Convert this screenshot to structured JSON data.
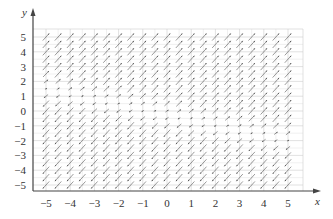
{
  "chart_data": {
    "type": "direction_field",
    "title": "",
    "xlabel": "x",
    "ylabel": "y",
    "xlim": [
      -5,
      5
    ],
    "ylim": [
      -5,
      5
    ],
    "xticks": [
      -5,
      -4,
      -3,
      -2,
      -1,
      0,
      1,
      2,
      3,
      4,
      5
    ],
    "yticks": [
      5,
      4,
      3,
      2,
      1,
      0,
      -1,
      -2,
      -3,
      -4,
      -5
    ],
    "xtick_labels": [
      "−5",
      "−4",
      "−3",
      "−2",
      "−1",
      "0",
      "1",
      "2",
      "3",
      "4",
      "5"
    ],
    "ytick_labels": [
      "5",
      "4",
      "3",
      "2",
      "1",
      "0",
      "−1",
      "−2",
      "−3",
      "−4",
      "−5"
    ],
    "grid": true,
    "sample_spacing": 0.5,
    "nullcline": {
      "x": [
        -5,
        0,
        5
      ],
      "y": [
        1.5,
        -0.25,
        -2
      ]
    },
    "colors": {
      "arrow": "#555555",
      "grid": "#cccccc",
      "axis": "#444444",
      "text": "#333333"
    }
  }
}
